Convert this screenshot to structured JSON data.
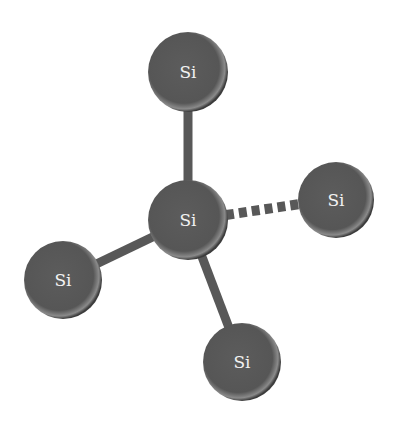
{
  "diagram": {
    "colors": {
      "atom_fill": "#5a5a5a",
      "atom_rim_highlight": "#a8a8a8",
      "atom_shadow": "#3a3a3a",
      "bond": "#585858",
      "label": "#f2f2f2",
      "background": "#ffffff"
    },
    "atoms": [
      {
        "id": "top",
        "label": "Si",
        "cx": 188,
        "cy": 72,
        "r": 40
      },
      {
        "id": "center",
        "label": "Si",
        "cx": 188,
        "cy": 220,
        "r": 40
      },
      {
        "id": "right",
        "label": "Si",
        "cx": 336,
        "cy": 200,
        "r": 38
      },
      {
        "id": "left",
        "label": "Si",
        "cx": 63,
        "cy": 280,
        "r": 39
      },
      {
        "id": "bottom",
        "label": "Si",
        "cx": 242,
        "cy": 362,
        "r": 39
      }
    ],
    "bonds": [
      {
        "from": "center",
        "to": "top",
        "style": "solid"
      },
      {
        "from": "center",
        "to": "right",
        "style": "dashed"
      },
      {
        "from": "center",
        "to": "left",
        "style": "solid"
      },
      {
        "from": "center",
        "to": "bottom",
        "style": "solid"
      }
    ]
  }
}
